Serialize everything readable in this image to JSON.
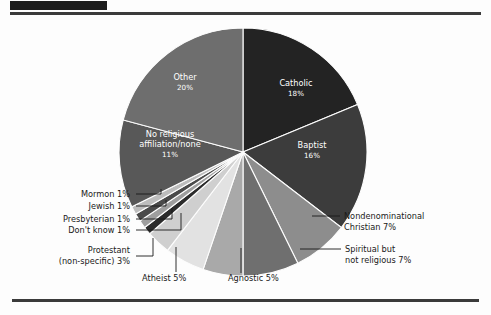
{
  "page": {
    "background": "#fdfdfd",
    "redacted_title_bar": "",
    "rule_color": "#3b3b3b"
  },
  "chart_data": {
    "type": "pie",
    "title": "",
    "subtitle": "",
    "xlabel": "",
    "ylabel": "",
    "legend_position": "none",
    "grid": false,
    "units": "percent",
    "start_angle_deg": 0,
    "direction": "clockwise",
    "center": {
      "x": 243,
      "y": 152
    },
    "radius": 124,
    "total": 100,
    "categories": [
      "Catholic",
      "Baptist",
      "Nondenominational Christian",
      "Spiritual but not religious",
      "Agnostic",
      "Atheist",
      "Protestant (non-specific)",
      "Don't know",
      "Presbyterian",
      "Jewish",
      "Mormon",
      "No religious affiliation/none",
      "Other"
    ],
    "values": [
      18,
      16,
      7,
      7,
      5,
      5,
      3,
      1,
      1,
      1,
      1,
      11,
      20
    ],
    "colors": [
      "#232323",
      "#3c3c3c",
      "#8d8d8d",
      "#6f6f6f",
      "#a9a9a9",
      "#e2e2e2",
      "#cfcfcf",
      "#2b2b2b",
      "#9e9e9e",
      "#4a4a4a",
      "#bdbdbd",
      "#585858",
      "#6e6e6e"
    ],
    "slices": [
      {
        "label": "Catholic",
        "value": 18,
        "pct_text": "18%",
        "color": "#232323",
        "label_placement": "inside",
        "text_color": "#ffffff"
      },
      {
        "label": "Baptist",
        "value": 16,
        "pct_text": "16%",
        "color": "#3c3c3c",
        "label_placement": "inside",
        "text_color": "#ffffff"
      },
      {
        "label": "Nondenominational Christian",
        "value": 7,
        "pct_text": "7%",
        "color": "#8d8d8d",
        "label_placement": "callout-right",
        "text_color": "#1a1a1a"
      },
      {
        "label": "Spiritual but not religious",
        "value": 7,
        "pct_text": "7%",
        "color": "#6f6f6f",
        "label_placement": "callout-right",
        "text_color": "#1a1a1a"
      },
      {
        "label": "Agnostic",
        "value": 5,
        "pct_text": "5%",
        "color": "#a9a9a9",
        "label_placement": "callout-bottom",
        "text_color": "#1a1a1a"
      },
      {
        "label": "Atheist",
        "value": 5,
        "pct_text": "5%",
        "color": "#e2e2e2",
        "label_placement": "callout-bottom",
        "text_color": "#1a1a1a"
      },
      {
        "label": "Protestant (non-specific)",
        "value": 3,
        "pct_text": "3%",
        "color": "#cfcfcf",
        "label_placement": "callout-left",
        "text_color": "#1a1a1a"
      },
      {
        "label": "Don't know",
        "value": 1,
        "pct_text": "1%",
        "color": "#2b2b2b",
        "label_placement": "callout-left",
        "text_color": "#1a1a1a"
      },
      {
        "label": "Presbyterian",
        "value": 1,
        "pct_text": "1%",
        "color": "#9e9e9e",
        "label_placement": "callout-left",
        "text_color": "#1a1a1a"
      },
      {
        "label": "Jewish",
        "value": 1,
        "pct_text": "1%",
        "color": "#4a4a4a",
        "label_placement": "callout-left",
        "text_color": "#1a1a1a"
      },
      {
        "label": "Mormon",
        "value": 1,
        "pct_text": "1%",
        "color": "#bdbdbd",
        "label_placement": "callout-left",
        "text_color": "#1a1a1a"
      },
      {
        "label": "No religious affiliation/none",
        "value": 11,
        "pct_text": "11%",
        "color": "#585858",
        "label_placement": "inside",
        "text_color": "#ffffff"
      },
      {
        "label": "Other",
        "value": 20,
        "pct_text": "20%",
        "color": "#6e6e6e",
        "label_placement": "inside",
        "text_color": "#ffffff"
      }
    ]
  },
  "inside_labels": [
    {
      "name": "catholic",
      "line1": "Catholic",
      "line2": "18%",
      "x": 296,
      "y": 86,
      "anchor": "middle"
    },
    {
      "name": "baptist",
      "line1": "Baptist",
      "line2": "16%",
      "x": 312,
      "y": 148,
      "anchor": "middle"
    },
    {
      "name": "other",
      "line1": "Other",
      "line2": "20%",
      "x": 185,
      "y": 80,
      "anchor": "middle"
    },
    {
      "name": "no-religious-affiliation",
      "line1": "No religious",
      "line2": "affiliation/none",
      "line3": "11%",
      "x": 170,
      "y": 137,
      "anchor": "middle"
    }
  ],
  "callouts": [
    {
      "name": "nondenominational-christian",
      "lines": [
        "Nondenominational",
        "Christian 7%"
      ],
      "text_x": 344,
      "text_y": 219,
      "anchor": "start",
      "line_path": "M 312 216 L 340 216"
    },
    {
      "name": "spiritual-but-not-religious",
      "lines": [
        "Spiritual but",
        "not religious 7%"
      ],
      "text_x": 345,
      "text_y": 252,
      "anchor": "start",
      "line_path": "M 300 249 L 341 249"
    },
    {
      "name": "agnostic",
      "lines": [
        "Agnostic 5%"
      ],
      "text_x": 228,
      "text_y": 281,
      "anchor": "start",
      "line_path": "M 241 248 L 241 273"
    },
    {
      "name": "atheist",
      "lines": [
        "Atheist 5%"
      ],
      "text_x": 142,
      "text_y": 281,
      "anchor": "start",
      "line_path": "M 176 247 L 176 268 L 176 272"
    },
    {
      "name": "protestant-non-specific",
      "lines": [
        "Protestant",
        "(non-specific) 3%"
      ],
      "text_x": 130,
      "text_y": 253,
      "anchor": "end",
      "line_path": "M 153 238 L 153 256 L 136 256"
    },
    {
      "name": "dont-know",
      "lines": [
        "Don't know 1%"
      ],
      "text_x": 130,
      "text_y": 233,
      "anchor": "end",
      "line_path": "M 181 213 L 181 230 L 136 230"
    },
    {
      "name": "presbyterian",
      "lines": [
        "Presbyterian 1%"
      ],
      "text_x": 130,
      "text_y": 222,
      "anchor": "end",
      "line_path": "M 172 208 L 172 219 L 136 219"
    },
    {
      "name": "jewish",
      "lines": [
        "Jewish 1%"
      ],
      "text_x": 130,
      "text_y": 209,
      "anchor": "end",
      "line_path": "M 166 200 L 166 206 L 136 206"
    },
    {
      "name": "mormon",
      "lines": [
        "Mormon 1%"
      ],
      "text_x": 130,
      "text_y": 197,
      "anchor": "end",
      "line_path": "M 161 189 L 161 194 L 136 194"
    }
  ]
}
